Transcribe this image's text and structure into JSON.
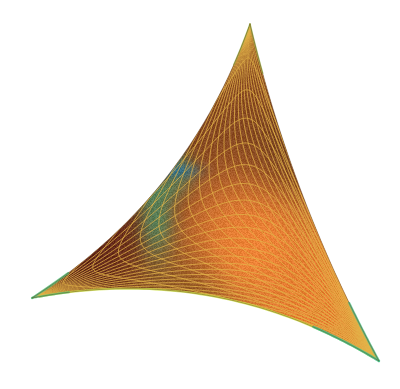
{
  "figure": {
    "type": "3d-surface-mesh",
    "background_color": "#ffffff",
    "width": 400,
    "height": 389
  },
  "chart_data": {
    "type": "surface",
    "xlabel": "",
    "ylabel": "",
    "zlabel": "",
    "grid": true,
    "legend": "none",
    "axes_visible": false,
    "tick_labels": [],
    "annotations": [],
    "patch_outline": {
      "description": "Rounded triangular silhouette with three corners joined by curved edges",
      "corners": [
        {
          "name": "apex",
          "x": 250,
          "y": 24
        },
        {
          "name": "left-corner",
          "x": 32,
          "y": 298
        },
        {
          "name": "right-corner",
          "x": 379,
          "y": 361
        }
      ],
      "edges": [
        {
          "name": "left-edge",
          "from": "apex",
          "to": "left-corner",
          "curvature": "convex-outward",
          "bulge": 30
        },
        {
          "name": "bottom-edge",
          "from": "left-corner",
          "to": "right-corner",
          "curvature": "concave-upward",
          "bulge": 34
        },
        {
          "name": "right-edge",
          "from": "right-corner",
          "to": "apex",
          "curvature": "slightly-convex",
          "bulge": 12
        }
      ]
    },
    "mesh": {
      "line_color": "#e3b44a",
      "line_width": 0.9,
      "family_a_count": 26,
      "family_b_count": 26,
      "pattern": "two intersecting families of curves forming diamond cells",
      "cell_shape": "curvilinear-quadrilateral"
    },
    "colormap": {
      "name": "orange-red-green-blue",
      "stops": [
        {
          "position": 0.0,
          "color": "#2b2f7a",
          "label": "singular-core-blue"
        },
        {
          "position": 0.08,
          "color": "#7a1420",
          "label": "dark-red"
        },
        {
          "position": 0.2,
          "color": "#3f8f6a",
          "label": "green-halo"
        },
        {
          "position": 0.35,
          "color": "#8f9a3c",
          "label": "olive"
        },
        {
          "position": 0.5,
          "color": "#9b5a22",
          "label": "brown"
        },
        {
          "position": 0.7,
          "color": "#e07a2c",
          "label": "orange"
        },
        {
          "position": 0.85,
          "color": "#f0883a",
          "label": "bright-orange"
        },
        {
          "position": 1.0,
          "color": "#5e2d18",
          "label": "dark-sienna"
        }
      ]
    },
    "shading_regions": [
      {
        "name": "apex-region",
        "x": 250,
        "y": 60,
        "color": "#8a4a22",
        "description": "dark brown-orange near top apex"
      },
      {
        "name": "upper-left-dark",
        "x": 130,
        "y": 120,
        "color": "#6e3a1c",
        "description": "dark sienna upper left flank"
      },
      {
        "name": "upper-right-dark",
        "x": 320,
        "y": 140,
        "color": "#6a3a1e",
        "description": "dark brown right flank"
      },
      {
        "name": "left-maroon",
        "x": 80,
        "y": 240,
        "color": "#5f2418",
        "description": "deep maroon lower-left"
      },
      {
        "name": "central-orange",
        "x": 255,
        "y": 250,
        "color": "#ef8336",
        "description": "bright orange central lobe"
      },
      {
        "name": "lower-right-orange",
        "x": 320,
        "y": 300,
        "color": "#e87c30",
        "description": "bright orange lower right"
      },
      {
        "name": "bottom-brown",
        "x": 180,
        "y": 315,
        "color": "#8a5424",
        "description": "mid brown along bottom edge"
      }
    ],
    "singular_point": {
      "name": "singularity",
      "x": 150,
      "y": 172,
      "core_color": "#6e1422",
      "accent_color": "#2c3f93",
      "halo_color": "#47946b",
      "streak": {
        "direction": "right",
        "length": 48,
        "color": "#2f6f8f",
        "description": "blue-cyan streak extending right from the dark core"
      },
      "tail": {
        "direction": "down-left",
        "length": 90,
        "color": "#57a37a",
        "description": "green band trailing down from the core"
      }
    },
    "rim_highlights": [
      {
        "name": "bottom-rim",
        "color": "#cfe24a",
        "description": "bright yellow-green rim along the bottom edge"
      },
      {
        "name": "right-corner-rim",
        "color": "#49c18a",
        "description": "green-cyan rim at the right corner"
      },
      {
        "name": "left-corner-rim",
        "color": "#55c07a",
        "description": "green rim at the left corner"
      },
      {
        "name": "apex-rim",
        "color": "#9fbf4a",
        "description": "olive-green rim near the apex"
      }
    ]
  }
}
